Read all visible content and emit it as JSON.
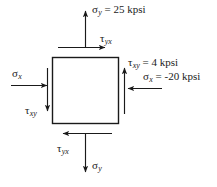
{
  "figure": {
    "type": "stress-element-diagram",
    "stroke_color": "#1a1a1a",
    "background_color": "#ffffff",
    "element": {
      "name": "stress-element-square",
      "x": 52,
      "y": 57,
      "width": 66,
      "height": 66
    },
    "labels": {
      "top_normal": {
        "symbol": "σ",
        "subscript": "y",
        "value": " = 25 kpsi",
        "full": "σy = 25 kpsi"
      },
      "top_shear": {
        "symbol": "τ",
        "subscript": "yx",
        "value": "",
        "full": "τyx"
      },
      "right_shear": {
        "symbol": "τ",
        "subscript": "xy",
        "value": " = 4 kpsi",
        "full": "τxy = 4 kpsi"
      },
      "right_normal": {
        "symbol": "σ",
        "subscript": "x",
        "value": " = -20 kpsi",
        "full": "σx = -20 kpsi"
      },
      "left_normal": {
        "symbol": "σ",
        "subscript": "x",
        "value": "",
        "full": "σx"
      },
      "left_shear": {
        "symbol": "τ",
        "subscript": "xy",
        "value": "",
        "full": "τxy"
      },
      "bottom_shear": {
        "symbol": "τ",
        "subscript": "yx",
        "value": "",
        "full": "τyx"
      },
      "bottom_normal": {
        "symbol": "σ",
        "subscript": "y",
        "value": "",
        "full": "σy"
      }
    },
    "stresses": {
      "sigma_x": -20,
      "sigma_y": 25,
      "tau_xy": 4,
      "units": "kpsi"
    }
  }
}
